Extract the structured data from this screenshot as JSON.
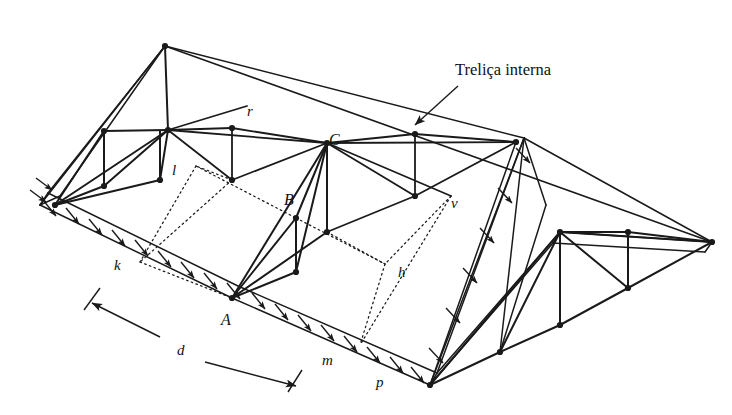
{
  "figure": {
    "background_color": "#ffffff",
    "line_color": "#1a1a1a",
    "annotation": {
      "text": "Treliça interna",
      "x": 455,
      "y": 75,
      "arrow_from": [
        458,
        86
      ],
      "arrow_to": [
        415,
        125
      ]
    },
    "point_labels": [
      {
        "id": "r",
        "text": "r",
        "x": 247,
        "y": 116,
        "style": "italic"
      },
      {
        "id": "C",
        "text": "C",
        "x": 329,
        "y": 145,
        "style": "italic-cap"
      },
      {
        "id": "l",
        "text": "l",
        "x": 172,
        "y": 175,
        "style": "italic"
      },
      {
        "id": "B",
        "text": "B",
        "x": 284,
        "y": 205,
        "style": "italic-cap"
      },
      {
        "id": "v",
        "text": "v",
        "x": 451,
        "y": 208,
        "style": "italic"
      },
      {
        "id": "k",
        "text": "k",
        "x": 114,
        "y": 270,
        "style": "italic"
      },
      {
        "id": "h",
        "text": "h",
        "x": 398,
        "y": 277,
        "style": "italic"
      },
      {
        "id": "A",
        "text": "A",
        "x": 221,
        "y": 325,
        "style": "italic-cap"
      },
      {
        "id": "d",
        "text": "d",
        "x": 177,
        "y": 355,
        "style": "italic"
      },
      {
        "id": "m",
        "text": "m",
        "x": 322,
        "y": 365,
        "style": "italic"
      },
      {
        "id": "p",
        "text": "p",
        "x": 376,
        "y": 387,
        "style": "italic"
      }
    ],
    "dimension": {
      "label": "d",
      "start": [
        92,
        303
      ],
      "end": [
        296,
        386
      ],
      "tick_start": [
        [
          100,
          288
        ],
        [
          84,
          310
        ]
      ],
      "tick_end": [
        [
          302,
          370
        ],
        [
          288,
          392
        ]
      ]
    },
    "geometry": {
      "ridge": {
        "left": [
          165,
          46
        ],
        "right": [
          524,
          138
        ]
      },
      "apex_left": [
        165,
        46
      ],
      "apex_right": [
        712,
        242
      ],
      "eave_front_left": [
        40,
        205
      ],
      "eave_front_mid": [
        232,
        298
      ],
      "eave_front_right": [
        430,
        385
      ],
      "description": "Hipped roof shown in axonometric projection with two internal trusses, purlins, dotted projection panel lines and distributed load arrows along both eave bands."
    },
    "load_arrows": {
      "count_left_eave": 9,
      "count_right_eave": 8,
      "count_hip": 6,
      "direction": "normal to roof surface, pointing down-right"
    }
  }
}
